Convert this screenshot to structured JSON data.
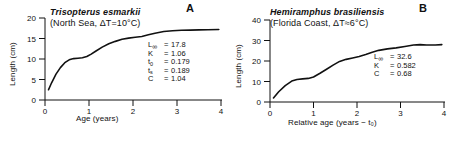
{
  "figure": {
    "panels": [
      {
        "letter": "A",
        "species": "Trisopterus esmarkii",
        "habitat": "(North Sea, ΔT=10°C)",
        "xlabel": "Age (years)",
        "ylabel": "Length (cm)",
        "params": [
          {
            "symbol": "L",
            "subscript": "∞",
            "eq": "=",
            "value": "17.8"
          },
          {
            "symbol": "K",
            "subscript": "",
            "eq": "=",
            "value": "1.06"
          },
          {
            "symbol": "t",
            "subscript": "0",
            "eq": "=",
            "value": "0.179"
          },
          {
            "symbol": "t",
            "subscript": "s",
            "eq": "=",
            "value": "0.189"
          },
          {
            "symbol": "C",
            "subscript": "",
            "eq": "=",
            "value": "1.04"
          }
        ]
      },
      {
        "letter": "B",
        "species": "Hemiramphus brasiliensis",
        "habitat": "(Florida Coast, ΔT≈6°C)",
        "xlabel": "Relative age (years − t₀)",
        "ylabel": "Length (cm)",
        "params": [
          {
            "symbol": "L",
            "subscript": "∞",
            "eq": "=",
            "value": "32.6"
          },
          {
            "symbol": "K",
            "subscript": "",
            "eq": "=",
            "value": "0.582"
          },
          {
            "symbol": "C",
            "subscript": "",
            "eq": "=",
            "value": "0.68"
          }
        ]
      }
    ]
  },
  "chart_data": [
    {
      "type": "line",
      "title": "Trisopterus esmarkii (North Sea, ΔT=10°C)",
      "xlabel": "Age (years)",
      "ylabel": "Length (cm)",
      "xlim": [
        0,
        4
      ],
      "ylim": [
        0,
        20
      ],
      "xticks": [
        0,
        1,
        2,
        3,
        4
      ],
      "yticks": [
        0,
        5,
        10,
        15,
        20
      ],
      "xtick_labels": [
        "0",
        "1",
        "2",
        "3",
        "4"
      ],
      "ytick_labels": [
        "0",
        "5",
        "10",
        "15",
        "20"
      ],
      "grid": false,
      "legend": "none",
      "annotations": [
        "L∞ =17.8",
        "K = 1.06",
        "t₀ = 0.179",
        "tₛ = 0.189",
        "C = 1.04"
      ],
      "series": [
        {
          "name": "seasonal von Bertalanffy growth",
          "x": [
            0.08,
            0.15,
            0.25,
            0.35,
            0.45,
            0.55,
            0.65,
            0.75,
            0.85,
            0.95,
            1.05,
            1.15,
            1.3,
            1.45,
            1.6,
            1.75,
            1.9,
            2.05,
            2.2,
            2.35,
            2.5,
            2.7,
            2.9,
            3.1,
            3.3,
            3.5,
            3.7,
            3.95
          ],
          "y": [
            2.5,
            4.2,
            6.3,
            7.9,
            9.1,
            9.8,
            10.1,
            10.2,
            10.3,
            10.6,
            11.2,
            11.9,
            12.9,
            13.7,
            14.3,
            14.8,
            15.1,
            15.3,
            15.5,
            15.9,
            16.3,
            16.7,
            16.9,
            17.0,
            17.05,
            17.1,
            17.15,
            17.2
          ]
        }
      ]
    },
    {
      "type": "line",
      "title": "Hemiramphus brasiliensis (Florida Coast, ΔT≈6°C)",
      "xlabel": "Relative age (years − t₀)",
      "ylabel": "Length (cm)",
      "xlim": [
        0,
        4
      ],
      "ylim": [
        0,
        40
      ],
      "xticks": [
        0,
        1,
        2,
        3,
        4
      ],
      "yticks": [
        0,
        10,
        20,
        30,
        40
      ],
      "xtick_labels": [
        "0",
        "1",
        "2",
        "3",
        "4"
      ],
      "ytick_labels": [
        "0",
        "10",
        "20",
        "30",
        "40"
      ],
      "grid": false,
      "legend": "none",
      "annotations": [
        "L∞= 32.6",
        "K = 0.582",
        "C = 0.68"
      ],
      "series": [
        {
          "name": "seasonal von Bertalanffy growth",
          "x": [
            0.08,
            0.2,
            0.35,
            0.5,
            0.62,
            0.75,
            0.88,
            1.0,
            1.15,
            1.3,
            1.45,
            1.6,
            1.75,
            1.9,
            2.05,
            2.2,
            2.35,
            2.5,
            2.7,
            2.9,
            3.1,
            3.3,
            3.45,
            3.6,
            3.8,
            3.95
          ],
          "y": [
            2.0,
            5.0,
            8.0,
            10.2,
            11.0,
            11.3,
            11.5,
            12.2,
            14.0,
            16.0,
            18.0,
            19.8,
            20.8,
            21.5,
            22.2,
            23.2,
            24.3,
            25.2,
            25.9,
            26.4,
            27.1,
            27.8,
            28.0,
            27.8,
            27.8,
            28.0
          ]
        }
      ]
    }
  ]
}
